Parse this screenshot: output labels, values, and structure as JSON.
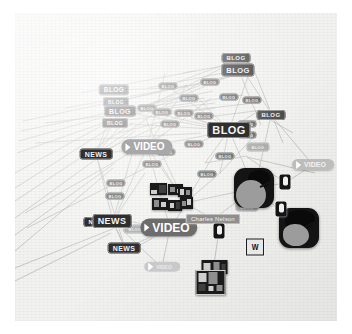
{
  "visualization": {
    "type": "force-directed-network-graph",
    "title": "Media entity network graph",
    "canvas": {
      "background_color": "#f2f2f0",
      "border_color": "#ffffff",
      "x": 15,
      "y": 13,
      "width": 322,
      "height": 308
    },
    "edge_color": "#9a9a9a",
    "node_categories": [
      "BLOG",
      "NEWS",
      "VIDEO",
      "person",
      "thumbnail",
      "logo"
    ]
  },
  "nodes": [
    {
      "id": "blog-tr-1",
      "label": "BLOG",
      "kind": "badge",
      "style": "mid",
      "size": 6,
      "x": 236,
      "y": 58
    },
    {
      "id": "blog-tr-2",
      "label": "BLOG",
      "kind": "badge",
      "style": "dark",
      "size": 7.5,
      "x": 238,
      "y": 70
    },
    {
      "id": "blog-l-1",
      "label": "BLOG",
      "kind": "badge",
      "style": "dark",
      "size": 6.5,
      "x": 114,
      "y": 90
    },
    {
      "id": "blog-l-2",
      "label": "BLOG",
      "kind": "badge",
      "style": "mid",
      "size": 5,
      "x": 116,
      "y": 102
    },
    {
      "id": "blog-l-3",
      "label": "BLOG",
      "kind": "badge",
      "style": "dark",
      "size": 7,
      "x": 120,
      "y": 111
    },
    {
      "id": "blog-l-4",
      "label": "BLOG",
      "kind": "badge",
      "style": "mid",
      "size": 5,
      "x": 115,
      "y": 123
    },
    {
      "id": "blog-big",
      "label": "BLOG",
      "kind": "badge",
      "style": "dark",
      "size": 11,
      "x": 229,
      "y": 130
    },
    {
      "id": "blog-r-1",
      "label": "BLOG",
      "kind": "badge",
      "style": "mid",
      "size": 6,
      "x": 271,
      "y": 115
    },
    {
      "id": "blog-c-1",
      "label": "BLOG",
      "kind": "badge",
      "style": "tiny",
      "size": 4,
      "x": 168,
      "y": 86
    },
    {
      "id": "blog-c-2",
      "label": "BLOG",
      "kind": "badge",
      "style": "tiny",
      "size": 4,
      "x": 210,
      "y": 82
    },
    {
      "id": "blog-c-3",
      "label": "BLOG",
      "kind": "badge",
      "style": "tiny",
      "size": 4,
      "x": 229,
      "y": 97
    },
    {
      "id": "blog-c-4",
      "label": "BLOG",
      "kind": "badge",
      "style": "tiny",
      "size": 4,
      "x": 189,
      "y": 98
    },
    {
      "id": "blog-c-5",
      "label": "BLOG",
      "kind": "badge",
      "style": "tiny",
      "size": 4,
      "x": 252,
      "y": 100
    },
    {
      "id": "blog-c-6",
      "label": "BLOG",
      "kind": "badge",
      "style": "tiny",
      "size": 4,
      "x": 147,
      "y": 108
    },
    {
      "id": "blog-c-7",
      "label": "BLOG",
      "kind": "badge",
      "style": "tiny",
      "size": 4,
      "x": 162,
      "y": 112
    },
    {
      "id": "blog-c-8",
      "label": "BLOG",
      "kind": "badge",
      "style": "tiny",
      "size": 4,
      "x": 184,
      "y": 113
    },
    {
      "id": "blog-c-9",
      "label": "BLOG",
      "kind": "badge",
      "style": "tiny",
      "size": 4,
      "x": 204,
      "y": 116
    },
    {
      "id": "blog-c-10",
      "label": "BLOG",
      "kind": "badge",
      "style": "tiny",
      "size": 4,
      "x": 247,
      "y": 124
    },
    {
      "id": "blog-c-11",
      "label": "BLOG",
      "kind": "badge",
      "style": "tiny",
      "size": 4,
      "x": 247,
      "y": 135
    },
    {
      "id": "blog-c-12",
      "label": "BLOG",
      "kind": "badge",
      "style": "tiny",
      "size": 4,
      "x": 170,
      "y": 124
    },
    {
      "id": "blog-c-13",
      "label": "BLOG",
      "kind": "badge",
      "style": "tiny",
      "size": 4,
      "x": 194,
      "y": 144
    },
    {
      "id": "blog-c-14",
      "label": "BLOG",
      "kind": "badge",
      "style": "tiny",
      "size": 4,
      "x": 166,
      "y": 152
    },
    {
      "id": "blog-c-15",
      "label": "BLOG",
      "kind": "badge",
      "style": "tiny",
      "size": 4,
      "x": 225,
      "y": 156
    },
    {
      "id": "blog-c-16",
      "label": "BLOG",
      "kind": "badge",
      "style": "tiny",
      "size": 4,
      "x": 152,
      "y": 164
    },
    {
      "id": "blog-c-17",
      "label": "BLOG",
      "kind": "badge",
      "style": "tiny",
      "size": 4,
      "x": 207,
      "y": 174
    },
    {
      "id": "blog-c-18",
      "label": "BLOG",
      "kind": "badge",
      "style": "tiny",
      "size": 4,
      "x": 116,
      "y": 183
    },
    {
      "id": "blog-c-19",
      "label": "BLOG",
      "kind": "badge",
      "style": "tiny",
      "size": 4,
      "x": 115,
      "y": 196
    },
    {
      "id": "blog-c-20",
      "label": "BLOG",
      "kind": "badge",
      "style": "ghost",
      "size": 4,
      "x": 247,
      "y": 207
    },
    {
      "id": "blog-c-21",
      "label": "BLOG",
      "kind": "badge",
      "style": "ghost",
      "size": 4,
      "x": 258,
      "y": 147
    },
    {
      "id": "blog-c-22",
      "label": "BLOG",
      "kind": "badge",
      "style": "ghost",
      "size": 4,
      "x": 135,
      "y": 229
    },
    {
      "id": "news-l-1",
      "label": "NEWS",
      "kind": "badge",
      "style": "dark",
      "size": 7,
      "x": 96,
      "y": 154
    },
    {
      "id": "news-b-1",
      "label": "NE",
      "kind": "badge",
      "style": "dark",
      "size": 6,
      "x": 93,
      "y": 222
    },
    {
      "id": "news-b-2",
      "label": "NEWS",
      "kind": "badge",
      "style": "dark",
      "size": 9,
      "x": 112,
      "y": 221
    },
    {
      "id": "news-b-3",
      "label": "NEWS",
      "kind": "badge",
      "style": "dark",
      "size": 7,
      "x": 124,
      "y": 248
    },
    {
      "id": "video-1",
      "label": "VIDEO",
      "kind": "pill",
      "style": "mid",
      "size": 10,
      "x": 147,
      "y": 147
    },
    {
      "id": "video-2",
      "label": "VIDEO",
      "kind": "pill",
      "style": "dark",
      "size": 12,
      "x": 169,
      "y": 228
    },
    {
      "id": "video-3",
      "label": "VIDEO",
      "kind": "pill",
      "style": "light",
      "size": 7,
      "x": 313,
      "y": 165
    },
    {
      "id": "video-4",
      "label": "VIDEO",
      "kind": "pill",
      "style": "vpale",
      "size": 5,
      "x": 162,
      "y": 267
    },
    {
      "id": "person-1",
      "label": "Charles Nelson",
      "kind": "person",
      "size": 6,
      "x": 213,
      "y": 219
    },
    {
      "id": "avatar-1",
      "label": "",
      "kind": "avatar",
      "x": 254,
      "y": 188
    },
    {
      "id": "avatar-2",
      "label": "",
      "kind": "avatar",
      "x": 299,
      "y": 228
    },
    {
      "id": "vicon-1",
      "label": "",
      "kind": "vicon",
      "x": 285,
      "y": 182
    },
    {
      "id": "vicon-2",
      "label": "",
      "kind": "vicon",
      "x": 281,
      "y": 209
    },
    {
      "id": "vicon-3",
      "label": "",
      "kind": "vicon",
      "x": 219,
      "y": 231
    },
    {
      "id": "photos-1",
      "label": "",
      "kind": "photo-cluster",
      "x": 172,
      "y": 199
    },
    {
      "id": "photos-2",
      "label": "",
      "kind": "photo-pair",
      "x": 212,
      "y": 277
    },
    {
      "id": "wlogo-1",
      "label": "W",
      "kind": "logo",
      "x": 255,
      "y": 247
    }
  ],
  "stats": {
    "node_count": 47,
    "label_kinds": 6
  }
}
